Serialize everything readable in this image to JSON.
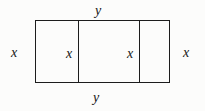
{
  "figure": {
    "type": "geometry-diagram",
    "colors": {
      "background": "#fcfcfb",
      "stroke": "#1c1c1c",
      "text": "#161616"
    },
    "outer_rectangle": {
      "left": 35,
      "top": 20,
      "width": 135,
      "height": 63
    },
    "dividers": [
      {
        "name": "divider-1",
        "x": 78
      },
      {
        "name": "divider-2",
        "x": 139
      }
    ],
    "labels": {
      "y_top": "y",
      "y_bottom": "y",
      "x_left": "x",
      "x_right": "x",
      "x_inner_1": "x",
      "x_inner_2": "x"
    }
  }
}
